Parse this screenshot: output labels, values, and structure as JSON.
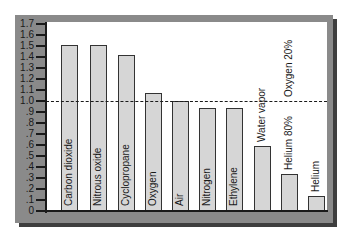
{
  "chart_data": {
    "type": "bar",
    "title": "",
    "xlabel": "",
    "ylabel": "",
    "ylim": [
      0,
      1.7
    ],
    "yticks": [
      "0",
      ".1",
      ".2",
      ".3",
      ".4",
      ".5",
      ".6",
      ".7",
      ".8",
      ".9",
      "1.0",
      "1.1",
      "1.2",
      "1.3",
      "1.4",
      "1.5",
      "1.6",
      "1.7"
    ],
    "categories": [
      "Carbon dioxide",
      "Nitrous oxide",
      "Cyclopropane",
      "Oxygen",
      "Air",
      "Nitrogen",
      "Ethylene",
      "Water vapor",
      "Helium 80%  Oxygen 20%",
      "Helium"
    ],
    "values": [
      1.51,
      1.51,
      1.42,
      1.07,
      1.0,
      0.94,
      0.94,
      0.59,
      0.34,
      0.14
    ],
    "reference_line": {
      "value": 1.0,
      "style": "dashed"
    },
    "grid": false,
    "legend": null
  },
  "labels": {
    "bar0": "Carbon dioxide",
    "bar1": "Nitrous oxide",
    "bar2": "Cyclopropane",
    "bar3": "Oxygen",
    "bar4": "Air",
    "bar5": "Nitrogen",
    "bar6": "Ethylene",
    "bar7": "Water vapor",
    "bar8a": "Helium 80%",
    "bar8b": "Oxygen 20%",
    "bar9": "Helium"
  },
  "colors": {
    "bar_fill": "#d6d6d6",
    "bar_border": "#333333",
    "frame": "#8a8a8a",
    "frame_shadow": "#3e3e3e",
    "plot_bg": "#ffffff"
  }
}
